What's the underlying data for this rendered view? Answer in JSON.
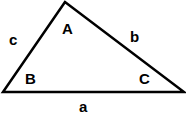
{
  "diagram": {
    "type": "triangle",
    "stroke_color": "#000000",
    "vertices": {
      "A": {
        "label": "A"
      },
      "B": {
        "label": "B"
      },
      "C": {
        "label": "C"
      }
    },
    "sides": {
      "a": {
        "label": "a"
      },
      "b": {
        "label": "b"
      },
      "c": {
        "label": "c"
      }
    }
  }
}
